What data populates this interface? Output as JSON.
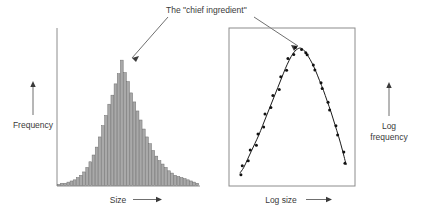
{
  "figure": {
    "annotation": {
      "text": "The \"chief ingredient\"",
      "points_to": [
        "histogram-peak",
        "curve-peak"
      ]
    }
  },
  "left_panel": {
    "ylabel": "Frequency",
    "xlabel": "Size",
    "xlabel_arrow": "→",
    "ylabel_arrow": "↑"
  },
  "right_panel": {
    "ylabel_line1": "Log",
    "ylabel_line2": "frequency",
    "xlabel": "Log size",
    "xlabel_arrow": "→",
    "ylabel_arrow": "↑"
  },
  "colors": {
    "bar_fill": "#a9a9a9",
    "bar_stroke": "#6e6e6e",
    "axis": "#8c8c8c",
    "curve": "#1a1a1a",
    "text": "#3a3a3a"
  },
  "chart_data": [
    {
      "type": "bar",
      "title": "",
      "xlabel": "Size",
      "ylabel": "Frequency",
      "grid": false,
      "legend": "none",
      "axis_style": "left-and-bottom-spines",
      "note": "Right-skewed (heavy-tailed) unimodal distribution on linear axes",
      "categories": [
        "b01",
        "b02",
        "b03",
        "b04",
        "b05",
        "b06",
        "b07",
        "b08",
        "b09",
        "b10",
        "b11",
        "b12",
        "b13",
        "b14",
        "b15",
        "b16",
        "b17",
        "b18",
        "b19",
        "b20",
        "b21",
        "b22",
        "b23",
        "b24",
        "b25",
        "b26",
        "b27",
        "b28",
        "b29",
        "b30",
        "b31",
        "b32",
        "b33",
        "b34",
        "b35",
        "b36",
        "b37",
        "b38",
        "b39",
        "b40",
        "b41",
        "b42",
        "b43",
        "b44",
        "b45"
      ],
      "values": [
        1,
        2,
        2,
        3,
        4,
        5,
        7,
        9,
        12,
        16,
        21,
        27,
        34,
        43,
        53,
        62,
        72,
        80,
        90,
        99,
        111,
        100,
        92,
        82,
        74,
        66,
        58,
        50,
        43,
        37,
        31,
        26,
        22,
        19,
        16,
        13,
        11,
        9,
        8,
        7,
        6,
        5,
        4,
        3,
        2
      ],
      "ylim": [
        0,
        120
      ],
      "xlim": [
        0,
        45
      ]
    },
    {
      "type": "scatter",
      "title": "",
      "xlabel": "Log size",
      "ylabel": "Log frequency",
      "grid": false,
      "legend": "none",
      "axis_style": "full-box-frame",
      "note": "Same distribution on log-log axes: markers with fitted smooth curve forming an inverted parabola",
      "x": [
        0,
        1,
        2,
        3,
        4,
        5,
        6,
        7,
        8,
        9,
        10,
        11,
        12,
        13,
        14,
        15,
        16,
        17,
        18,
        19,
        20,
        21,
        22,
        23,
        24,
        25,
        26,
        27,
        28
      ],
      "y": [
        5,
        9,
        15,
        21,
        27,
        33,
        40,
        47,
        54,
        61,
        68,
        75,
        82,
        88,
        93,
        96,
        97,
        95,
        91,
        86,
        80,
        73,
        66,
        58,
        50,
        41,
        32,
        22,
        11
      ],
      "xlim": [
        -1,
        29
      ],
      "ylim": [
        0,
        100
      ]
    }
  ]
}
